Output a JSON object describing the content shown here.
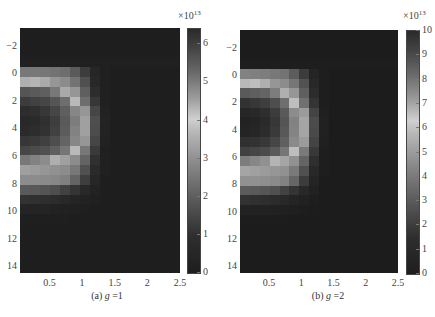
{
  "figure": {
    "panels": [
      {
        "id": "a",
        "caption_prefix": "(a) ",
        "caption_var": "g",
        "caption_suffix": " =1",
        "colorbar_exponent_base": "×10",
        "colorbar_exponent_power": "13"
      },
      {
        "id": "b",
        "caption_prefix": "(b) ",
        "caption_var": "g",
        "caption_suffix": " =2",
        "colorbar_exponent_base": "×10",
        "colorbar_exponent_power": "13"
      }
    ]
  },
  "chart_data": [
    {
      "type": "heatmap",
      "title": "(a) g =1",
      "xlabel": "",
      "ylabel": "",
      "x_ticks": [
        "0.5",
        "1",
        "1.5",
        "2",
        "2.5"
      ],
      "y_ticks": [
        "-2",
        "0",
        "2",
        "4",
        "6",
        "8",
        "10",
        "12",
        "14"
      ],
      "xlim": [
        0.05,
        2.5
      ],
      "ylim": [
        14.5,
        -3.3
      ],
      "y_axis_inverted": true,
      "colorbar": {
        "ticks": [
          "0",
          "1",
          "2",
          "3",
          "4",
          "5",
          "6"
        ],
        "range": [
          0,
          6.4
        ],
        "multiplier": "×10^13",
        "colormap": "grayscale-converted jet (dark at both ends, light near middle)"
      },
      "grid_cols": 16,
      "grid_rows": 25,
      "description": "Half-ring of high values centered near x≈0, y≈3; outer radius ≈1.0 in x, spanning y≈0–7; inner core lower; remainder near zero",
      "intensity": [
        [
          30,
          30,
          30,
          30,
          30,
          30,
          30,
          30,
          30,
          30,
          30,
          30,
          30,
          30,
          30,
          30
        ],
        [
          30,
          30,
          30,
          30,
          30,
          30,
          30,
          30,
          30,
          30,
          30,
          30,
          30,
          30,
          30,
          30
        ],
        [
          30,
          30,
          30,
          30,
          30,
          30,
          30,
          30,
          30,
          30,
          30,
          30,
          30,
          30,
          30,
          30
        ],
        [
          32,
          32,
          32,
          32,
          32,
          32,
          32,
          32,
          32,
          32,
          32,
          32,
          32,
          32,
          32,
          32
        ],
        [
          120,
          120,
          118,
          115,
          110,
          90,
          60,
          38,
          32,
          30,
          30,
          30,
          30,
          30,
          30,
          30
        ],
        [
          175,
          180,
          170,
          150,
          140,
          115,
          80,
          40,
          32,
          30,
          30,
          30,
          30,
          30,
          30,
          30
        ],
        [
          85,
          90,
          95,
          120,
          170,
          150,
          95,
          45,
          32,
          30,
          30,
          30,
          30,
          30,
          30,
          30
        ],
        [
          60,
          65,
          70,
          85,
          110,
          185,
          110,
          55,
          32,
          30,
          30,
          30,
          30,
          30,
          30,
          30
        ],
        [
          45,
          48,
          55,
          70,
          95,
          135,
          150,
          70,
          34,
          30,
          30,
          30,
          30,
          30,
          30,
          30
        ],
        [
          40,
          42,
          48,
          62,
          90,
          125,
          160,
          78,
          35,
          30,
          30,
          30,
          30,
          30,
          30,
          30
        ],
        [
          42,
          45,
          50,
          65,
          92,
          130,
          160,
          76,
          35,
          30,
          30,
          30,
          30,
          30,
          30,
          30
        ],
        [
          55,
          58,
          64,
          78,
          100,
          135,
          150,
          70,
          34,
          30,
          30,
          30,
          30,
          30,
          30,
          30
        ],
        [
          70,
          75,
          80,
          95,
          118,
          185,
          120,
          58,
          32,
          30,
          30,
          30,
          30,
          30,
          30,
          30
        ],
        [
          120,
          130,
          140,
          175,
          160,
          140,
          100,
          48,
          32,
          30,
          30,
          30,
          30,
          30,
          30,
          30
        ],
        [
          160,
          155,
          150,
          145,
          140,
          120,
          80,
          42,
          32,
          30,
          30,
          30,
          30,
          30,
          30,
          30
        ],
        [
          140,
          140,
          138,
          135,
          128,
          100,
          62,
          38,
          30,
          30,
          30,
          30,
          30,
          30,
          30,
          30
        ],
        [
          90,
          88,
          84,
          78,
          65,
          52,
          40,
          34,
          30,
          30,
          30,
          30,
          30,
          30,
          30,
          30
        ],
        [
          50,
          48,
          46,
          44,
          40,
          36,
          34,
          32,
          30,
          30,
          30,
          30,
          30,
          30,
          30,
          30
        ],
        [
          36,
          36,
          36,
          34,
          33,
          32,
          31,
          30,
          30,
          30,
          30,
          30,
          30,
          30,
          30,
          30
        ],
        [
          31,
          31,
          31,
          31,
          31,
          30,
          30,
          30,
          30,
          30,
          30,
          30,
          30,
          30,
          30,
          30
        ],
        [
          30,
          30,
          30,
          30,
          30,
          30,
          30,
          30,
          30,
          30,
          30,
          30,
          30,
          30,
          30,
          30
        ],
        [
          30,
          30,
          30,
          30,
          30,
          30,
          30,
          30,
          30,
          30,
          30,
          30,
          30,
          30,
          30,
          30
        ],
        [
          30,
          30,
          30,
          30,
          30,
          30,
          30,
          30,
          30,
          30,
          30,
          30,
          30,
          30,
          30,
          30
        ],
        [
          30,
          30,
          30,
          30,
          30,
          30,
          30,
          30,
          30,
          30,
          30,
          30,
          30,
          30,
          30,
          30
        ],
        [
          30,
          30,
          30,
          30,
          30,
          30,
          30,
          30,
          30,
          30,
          30,
          30,
          30,
          30,
          30,
          30
        ]
      ]
    },
    {
      "type": "heatmap",
      "title": "(b) g =2",
      "xlabel": "",
      "ylabel": "",
      "x_ticks": [
        "0.5",
        "1",
        "1.5",
        "2",
        "2.5"
      ],
      "y_ticks": [
        "-2",
        "0",
        "2",
        "4",
        "6",
        "8",
        "10",
        "12",
        "14"
      ],
      "xlim": [
        0.05,
        2.5
      ],
      "ylim": [
        14.5,
        -3.3
      ],
      "y_axis_inverted": true,
      "colorbar": {
        "ticks": [
          "0",
          "1",
          "2",
          "3",
          "4",
          "5",
          "6",
          "7",
          "8",
          "9",
          "10"
        ],
        "range": [
          0,
          10
        ],
        "multiplier": "×10^13",
        "colormap": "grayscale-converted jet (dark at both ends, light near middle)"
      },
      "grid_cols": 16,
      "grid_rows": 25,
      "description": "Similar half-ring of high values near x≈0–1, y≈0–7 with darker core; remainder near zero",
      "intensity": [
        [
          28,
          28,
          28,
          28,
          28,
          28,
          28,
          28,
          28,
          28,
          28,
          28,
          28,
          28,
          28,
          28
        ],
        [
          28,
          28,
          28,
          28,
          28,
          28,
          28,
          28,
          28,
          28,
          28,
          28,
          28,
          28,
          28,
          28
        ],
        [
          28,
          28,
          28,
          28,
          28,
          28,
          28,
          28,
          28,
          28,
          28,
          28,
          28,
          28,
          28,
          28
        ],
        [
          30,
          30,
          30,
          30,
          30,
          30,
          30,
          30,
          30,
          30,
          30,
          30,
          30,
          30,
          30,
          30
        ],
        [
          130,
          128,
          125,
          120,
          115,
          92,
          60,
          36,
          30,
          28,
          28,
          28,
          28,
          28,
          28,
          28
        ],
        [
          185,
          190,
          175,
          150,
          140,
          118,
          82,
          40,
          30,
          28,
          28,
          28,
          28,
          28,
          28,
          28
        ],
        [
          90,
          95,
          100,
          125,
          175,
          150,
          95,
          44,
          30,
          28,
          28,
          28,
          28,
          28,
          28,
          28
        ],
        [
          50,
          55,
          62,
          78,
          110,
          190,
          112,
          52,
          30,
          28,
          28,
          28,
          28,
          28,
          28,
          28
        ],
        [
          38,
          40,
          46,
          60,
          90,
          140,
          155,
          68,
          32,
          28,
          28,
          28,
          28,
          28,
          28,
          28
        ],
        [
          34,
          36,
          42,
          55,
          85,
          130,
          165,
          76,
          33,
          28,
          28,
          28,
          28,
          28,
          28,
          28
        ],
        [
          36,
          38,
          44,
          58,
          88,
          132,
          165,
          74,
          33,
          28,
          28,
          28,
          28,
          28,
          28,
          28
        ],
        [
          48,
          50,
          56,
          70,
          96,
          138,
          155,
          68,
          32,
          28,
          28,
          28,
          28,
          28,
          28,
          28
        ],
        [
          65,
          70,
          76,
          90,
          118,
          190,
          122,
          56,
          30,
          28,
          28,
          28,
          28,
          28,
          28,
          28
        ],
        [
          125,
          135,
          145,
          180,
          165,
          145,
          100,
          46,
          30,
          28,
          28,
          28,
          28,
          28,
          28,
          28
        ],
        [
          165,
          160,
          155,
          150,
          145,
          122,
          80,
          40,
          30,
          28,
          28,
          28,
          28,
          28,
          28,
          28
        ],
        [
          145,
          145,
          142,
          138,
          130,
          102,
          60,
          36,
          28,
          28,
          28,
          28,
          28,
          28,
          28,
          28
        ],
        [
          92,
          90,
          86,
          80,
          66,
          52,
          40,
          33,
          28,
          28,
          28,
          28,
          28,
          28,
          28,
          28
        ],
        [
          50,
          48,
          46,
          44,
          40,
          36,
          33,
          30,
          28,
          28,
          28,
          28,
          28,
          28,
          28,
          28
        ],
        [
          34,
          34,
          34,
          33,
          32,
          31,
          30,
          29,
          28,
          28,
          28,
          28,
          28,
          28,
          28,
          28
        ],
        [
          29,
          29,
          29,
          29,
          29,
          28,
          28,
          28,
          28,
          28,
          28,
          28,
          28,
          28,
          28,
          28
        ],
        [
          28,
          28,
          28,
          28,
          28,
          28,
          28,
          28,
          28,
          28,
          28,
          28,
          28,
          28,
          28,
          28
        ],
        [
          28,
          28,
          28,
          28,
          28,
          28,
          28,
          28,
          28,
          28,
          28,
          28,
          28,
          28,
          28,
          28
        ],
        [
          28,
          28,
          28,
          28,
          28,
          28,
          28,
          28,
          28,
          28,
          28,
          28,
          28,
          28,
          28,
          28
        ],
        [
          28,
          28,
          28,
          28,
          28,
          28,
          28,
          28,
          28,
          28,
          28,
          28,
          28,
          28,
          28,
          28
        ],
        [
          28,
          28,
          28,
          28,
          28,
          28,
          28,
          28,
          28,
          28,
          28,
          28,
          28,
          28,
          28,
          28
        ]
      ]
    }
  ]
}
